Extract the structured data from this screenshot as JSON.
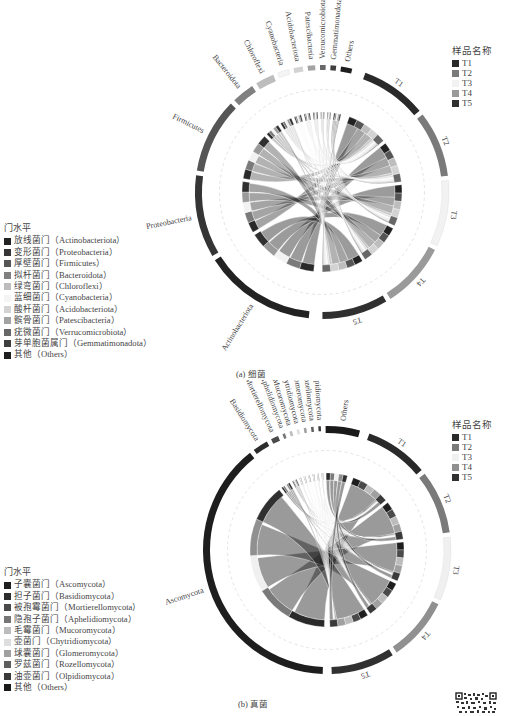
{
  "panel_a": {
    "caption": "(a) 细菌",
    "sample_legend": {
      "title": "样品名称",
      "items": [
        {
          "label": "T1",
          "color": "#2a2a2a"
        },
        {
          "label": "T2",
          "color": "#7a7a7a"
        },
        {
          "label": "T3",
          "color": "#f2f2f2"
        },
        {
          "label": "T4",
          "color": "#9a9a9a"
        },
        {
          "label": "T5",
          "color": "#303030"
        }
      ]
    },
    "phylum_legend": {
      "title": "门水平",
      "items": [
        {
          "label": "放线菌门（Actinobacteriota）",
          "color": "#222222"
        },
        {
          "label": "变形菌门（Proteobacteria）",
          "color": "#353535"
        },
        {
          "label": "厚壁菌门（Firmicutes）",
          "color": "#555555"
        },
        {
          "label": "拟杆菌门（Bacteroidota）",
          "color": "#808080"
        },
        {
          "label": "绿弯菌门（Chloroflexi）",
          "color": "#bdbdbd"
        },
        {
          "label": "蓝细菌门（Cyanobacteria）",
          "color": "#f4f4f4"
        },
        {
          "label": "酸杆菌门（Acidobacteriota）",
          "color": "#d3d3d3"
        },
        {
          "label": "髌骨菌门（Patescibacteria）",
          "color": "#a3a3a3"
        },
        {
          "label": "疣微菌门（Verrucomicrobiota）",
          "color": "#676767"
        },
        {
          "label": "芽单胞菌属门（Gemmatimonadota）",
          "color": "#3e3e3e"
        },
        {
          "label": "其他（Others）",
          "color": "#1e1e1e"
        }
      ]
    }
  },
  "panel_b": {
    "caption": "(b) 真菌",
    "sample_legend": {
      "title": "样品名称",
      "items": [
        {
          "label": "T1",
          "color": "#2a2a2a"
        },
        {
          "label": "T2",
          "color": "#7a7a7a"
        },
        {
          "label": "T3",
          "color": "#f0f0f0"
        },
        {
          "label": "T4",
          "color": "#909090"
        },
        {
          "label": "T5",
          "color": "#303030"
        }
      ]
    },
    "phylum_legend": {
      "title": "门水平",
      "items": [
        {
          "label": "子囊菌门（Ascomycota）",
          "color": "#1e1e1e"
        },
        {
          "label": "担子菌门（Basidiomycota）",
          "color": "#2c2c2c"
        },
        {
          "label": "被孢霉菌门（Mortierellomycota）",
          "color": "#4a4a4a"
        },
        {
          "label": "隐孢子菌门（Aphelidiomycota）",
          "color": "#767676"
        },
        {
          "label": "毛霉菌门（Mucoromycota）",
          "color": "#bcbcbc"
        },
        {
          "label": "壶菌门（Chytridiomycota）",
          "color": "#dedede"
        },
        {
          "label": "球囊菌门（Glomeromycota）",
          "color": "#a0a0a0"
        },
        {
          "label": "罗兹菌门（Rozellomycota）",
          "color": "#5e5e5e"
        },
        {
          "label": "油壶菌门（Olpidiomycota）",
          "color": "#3a3a3a"
        },
        {
          "label": "其他（Others）",
          "color": "#1a1a1a"
        }
      ]
    }
  },
  "chart_data": [
    {
      "type": "chord",
      "title": "(a) 细菌",
      "legend_titles": {
        "groups": "门水平",
        "samples": "样品名称"
      },
      "samples": [
        "T1",
        "T2",
        "T3",
        "T4",
        "T5"
      ],
      "groups": [
        "Actinobacteriota",
        "Proteobacteria",
        "Firmicutes",
        "Bacteroidota",
        "Chloroflexi",
        "Cyanobacteria",
        "Acidobacteriota",
        "Patescibacteria",
        "Verrucomicrobiota",
        "Gemmatimonadota",
        "Others"
      ],
      "group_arc_sizes": [
        0.3,
        0.22,
        0.2,
        0.06,
        0.05,
        0.03,
        0.025,
        0.02,
        0.015,
        0.015,
        0.03
      ],
      "sample_arc_sizes": [
        1,
        1,
        1,
        1,
        1
      ],
      "legend_position": "left-bottom (groups), right-top (samples)"
    },
    {
      "type": "chord",
      "title": "(b) 真菌",
      "legend_titles": {
        "groups": "门水平",
        "samples": "样品名称"
      },
      "samples": [
        "T1",
        "T2",
        "T3",
        "T4",
        "T5"
      ],
      "groups": [
        "Ascomycota",
        "Basidiomycota",
        "Mortierellomycota",
        "Aphelidiomycota",
        "Mucoromycota",
        "Chytridiomycota",
        "Glomeromycota",
        "Rozellomycota",
        "Olpidiomycota",
        "Others"
      ],
      "group_arc_sizes": [
        0.78,
        0.04,
        0.02,
        0.006,
        0.005,
        0.005,
        0.005,
        0.005,
        0.005,
        0.09
      ],
      "sample_arc_sizes": [
        1,
        1,
        1,
        1,
        1
      ],
      "legend_position": "left-bottom (groups), right-top (samples)"
    }
  ]
}
